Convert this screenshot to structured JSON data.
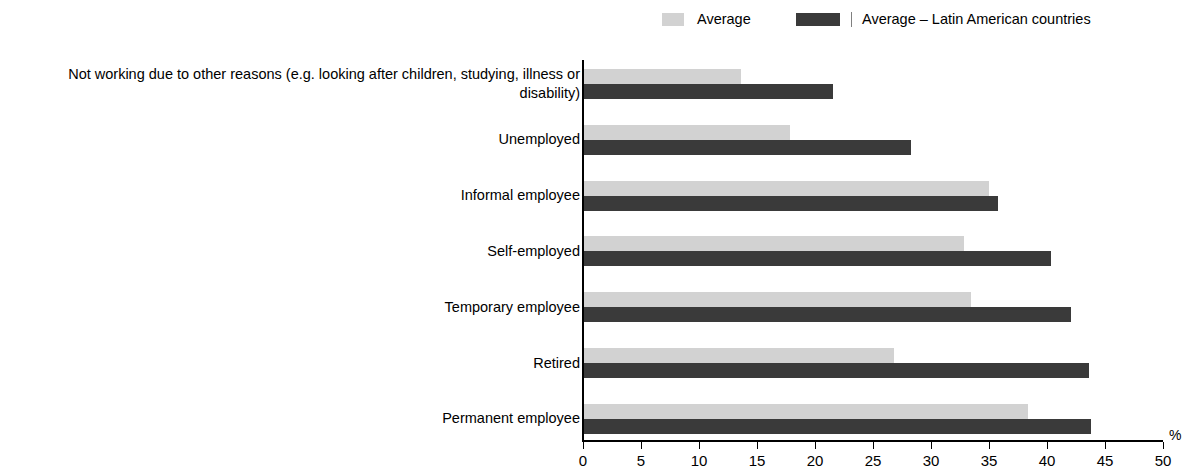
{
  "legend": {
    "entries": [
      {
        "label": "Average",
        "color": "#d2d2d2",
        "key": "average"
      },
      {
        "label": "Average – Latin American countries",
        "color": "#3a3a3a",
        "key": "average_latam"
      }
    ]
  },
  "axis": {
    "unit": "%",
    "ticks": [
      "0",
      "5",
      "10",
      "15",
      "20",
      "25",
      "30",
      "35",
      "40",
      "45",
      "50"
    ]
  },
  "chart_data": {
    "type": "bar",
    "orientation": "horizontal",
    "title": "",
    "subtitle": "",
    "xlabel": "%",
    "ylabel": "",
    "xlim": [
      0,
      50
    ],
    "xticks": [
      0,
      5,
      10,
      15,
      20,
      25,
      30,
      35,
      40,
      45,
      50
    ],
    "grid": false,
    "legend_position": "top",
    "categories": [
      "Not working due to other reasons (e.g. looking after children, studying, illness or disability)",
      "Unemployed",
      "Informal employee",
      "Self-employed",
      "Temporary employee",
      "Retired",
      "Permanent employee"
    ],
    "series": [
      {
        "name": "Average",
        "color": "#d2d2d2",
        "values": [
          13.5,
          17.8,
          34.9,
          32.8,
          33.4,
          26.7,
          38.3
        ]
      },
      {
        "name": "Average – Latin American countries",
        "color": "#3a3a3a",
        "values": [
          21.5,
          28.2,
          35.7,
          40.3,
          42.0,
          43.5,
          43.7
        ]
      }
    ]
  }
}
